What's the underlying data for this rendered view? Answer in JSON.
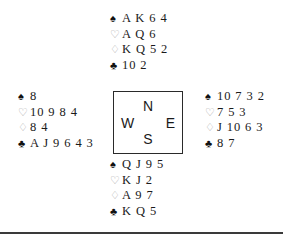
{
  "diagram": {
    "type": "bridge-hand-deal",
    "background_color": "#ffffff",
    "suit_symbols": {
      "spades": "♠",
      "hearts": "♡",
      "diamonds": "♢",
      "clubs": "♣"
    },
    "suit_colors": {
      "spades": "#111111",
      "hearts": "#a8a8a8",
      "diamonds": "#a8a8a8",
      "clubs": "#111111"
    },
    "compass": {
      "north": "N",
      "east": "E",
      "south": "S",
      "west": "W",
      "border_color": "#2a2a2a"
    },
    "hands": {
      "north": {
        "label": "North",
        "spades": "A K 6 4",
        "hearts": "A Q 6",
        "diamonds": "K Q 5 2",
        "clubs": "10 2"
      },
      "west": {
        "label": "West",
        "spades": "8",
        "hearts": "10 9 8 4",
        "diamonds": "8 4",
        "clubs": "A J 9 6 4 3"
      },
      "east": {
        "label": "East",
        "spades": "10 7 3 2",
        "hearts": "7 5 3",
        "diamonds": "J 10 6 3",
        "clubs": "8 7"
      },
      "south": {
        "label": "South",
        "spades": "Q J 9 5",
        "hearts": "K J 2",
        "diamonds": "A 9 7",
        "clubs": "K Q 5"
      }
    },
    "rule_color": "#3a3a3a"
  }
}
